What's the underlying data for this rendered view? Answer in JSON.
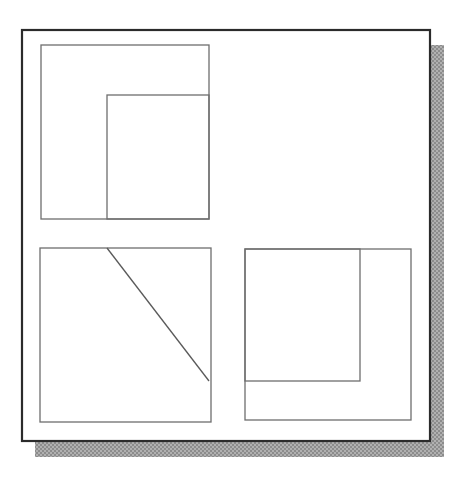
{
  "canvas": {
    "width": 466,
    "height": 486,
    "background": "#ffffff"
  },
  "figure": {
    "title": "nested-rectangles-diagram",
    "description": "Scanned line drawing: a bordered page panel with a drop shadow containing three sub-panels of nested rectangles and one diagonal line.",
    "colors": {
      "page_fill": "#ffffff",
      "frame_stroke": "#2b2b2b",
      "box_stroke": "#6e6e6e",
      "line_stroke": "#5a5a5a",
      "shadow_fill": "#9a9a9a",
      "shadow_fill_light": "#b5b5b5"
    },
    "stroke_widths": {
      "frame": 2.2,
      "box": 1.3,
      "diagonal": 1.3
    },
    "shadow": {
      "name": "drop-shadow",
      "offset_x": 13,
      "offset_y": 15,
      "x": 35,
      "y": 45,
      "width": 409,
      "height": 412
    },
    "frame": {
      "name": "outer-frame",
      "x": 22,
      "y": 30,
      "width": 408,
      "height": 411
    },
    "panels": [
      {
        "name": "panel-top-left",
        "outer_rect": {
          "x": 41,
          "y": 45,
          "width": 168,
          "height": 174
        },
        "inner_rect": {
          "x": 107,
          "y": 95,
          "width": 102,
          "height": 124
        },
        "has_diagonal": false
      },
      {
        "name": "panel-bottom-left",
        "outer_rect": {
          "x": 40,
          "y": 248,
          "width": 171,
          "height": 174
        },
        "inner_rect": null,
        "has_diagonal": true,
        "diagonal": {
          "x1": 107,
          "y1": 248,
          "x2": 209,
          "y2": 381
        }
      },
      {
        "name": "panel-bottom-right",
        "outer_rect": {
          "x": 245,
          "y": 249,
          "width": 166,
          "height": 171
        },
        "inner_rect": {
          "x": 245,
          "y": 249,
          "width": 115,
          "height": 132
        },
        "has_diagonal": false
      }
    ]
  }
}
